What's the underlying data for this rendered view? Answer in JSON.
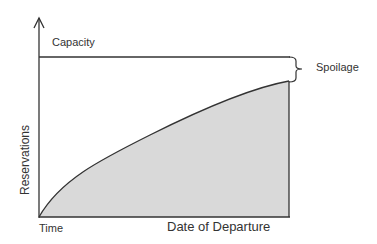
{
  "diagram": {
    "labels": {
      "capacity": "Capacity",
      "spoilage": "Spoilage",
      "y_axis": "Reservations",
      "x_start": "Time",
      "x_end": "Date of Departure"
    },
    "colors": {
      "line": "#333333",
      "fill": "#d9d9d9"
    }
  }
}
